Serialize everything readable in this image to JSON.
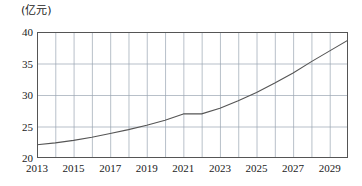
{
  "chart_data": {
    "type": "line",
    "title": "",
    "subtitle": "",
    "unit_label": "(亿元)",
    "xlabel": "",
    "ylabel": "亿元",
    "xlim": [
      2013,
      2030
    ],
    "ylim": [
      20,
      40
    ],
    "grid": true,
    "legend_position": "none",
    "y_ticks": [
      20,
      25,
      30,
      35,
      40
    ],
    "y_tick_labels": [
      "20",
      "25",
      "30",
      "35",
      "40"
    ],
    "x_ticks": [
      2013,
      2014,
      2015,
      2016,
      2017,
      2018,
      2019,
      2020,
      2021,
      2022,
      2023,
      2024,
      2025,
      2026,
      2027,
      2028,
      2029,
      2030
    ],
    "x_tick_labels_shown": [
      "2013",
      "2015",
      "2017",
      "2019",
      "2021",
      "2023",
      "2025",
      "2027",
      "2029"
    ],
    "x_tick_label_years": [
      2013,
      2015,
      2017,
      2019,
      2021,
      2023,
      2025,
      2027,
      2029
    ],
    "series": [
      {
        "name": "金额",
        "color": "#555555",
        "x": [
          2013,
          2014,
          2015,
          2016,
          2017,
          2018,
          2019,
          2020,
          2021,
          2022,
          2023,
          2024,
          2025,
          2026,
          2027,
          2028,
          2029,
          2030
        ],
        "values": [
          22.1,
          22.4,
          22.8,
          23.3,
          23.9,
          24.5,
          25.2,
          26.0,
          27.0,
          27.0,
          27.9,
          29.1,
          30.4,
          31.9,
          33.5,
          35.3,
          37.0,
          38.7
        ]
      }
    ],
    "annotations": [
      {
        "text": "flat segment between 2021 and 2022 at 27.0",
        "x_start": 2021,
        "x_end": 2022,
        "y": 27.0
      }
    ]
  },
  "axes": {
    "frame_color": "#555555",
    "grid_color": "#9aa5b1",
    "line_color": "#555555",
    "text_color": "#1a1a1a"
  }
}
